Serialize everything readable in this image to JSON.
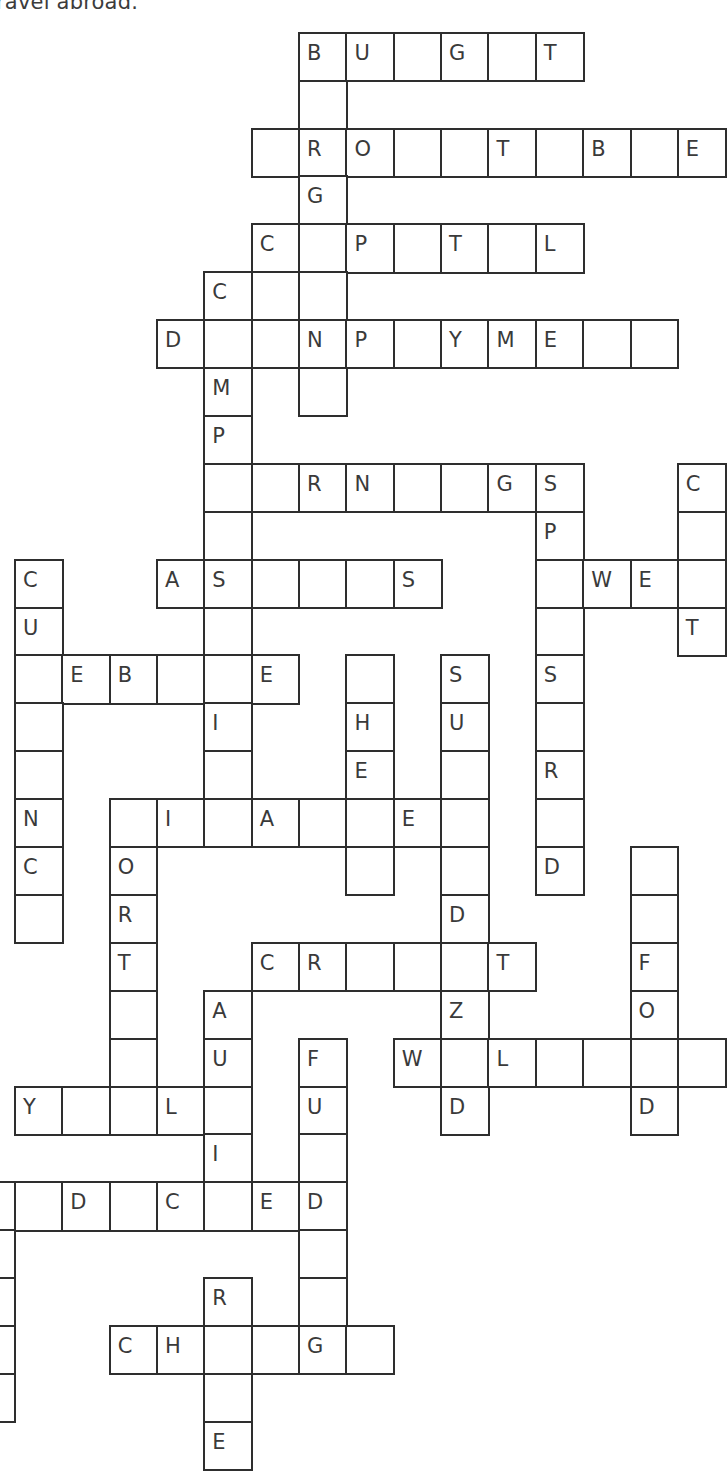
{
  "caption": "ravel abroad.",
  "grid": {
    "origin_x": 15.2,
    "origin_y": 33,
    "cell_w": 47.35,
    "cell_h": 47.9,
    "cells": [
      {
        "r": 0,
        "c": 6,
        "ch": "B"
      },
      {
        "r": 0,
        "c": 7,
        "ch": "U"
      },
      {
        "r": 0,
        "c": 8,
        "ch": ""
      },
      {
        "r": 0,
        "c": 9,
        "ch": "G"
      },
      {
        "r": 0,
        "c": 10,
        "ch": ""
      },
      {
        "r": 0,
        "c": 11,
        "ch": "T"
      },
      {
        "r": 1,
        "c": 6,
        "ch": ""
      },
      {
        "r": 2,
        "c": 5,
        "ch": ""
      },
      {
        "r": 2,
        "c": 6,
        "ch": "R"
      },
      {
        "r": 2,
        "c": 7,
        "ch": "O"
      },
      {
        "r": 2,
        "c": 8,
        "ch": ""
      },
      {
        "r": 2,
        "c": 9,
        "ch": ""
      },
      {
        "r": 2,
        "c": 10,
        "ch": "T"
      },
      {
        "r": 2,
        "c": 11,
        "ch": ""
      },
      {
        "r": 2,
        "c": 12,
        "ch": "B"
      },
      {
        "r": 2,
        "c": 13,
        "ch": ""
      },
      {
        "r": 2,
        "c": 14,
        "ch": "E"
      },
      {
        "r": 3,
        "c": 6,
        "ch": "G"
      },
      {
        "r": 4,
        "c": 5,
        "ch": "C"
      },
      {
        "r": 4,
        "c": 6,
        "ch": ""
      },
      {
        "r": 4,
        "c": 7,
        "ch": "P"
      },
      {
        "r": 4,
        "c": 8,
        "ch": ""
      },
      {
        "r": 4,
        "c": 9,
        "ch": "T"
      },
      {
        "r": 4,
        "c": 10,
        "ch": ""
      },
      {
        "r": 4,
        "c": 11,
        "ch": "L"
      },
      {
        "r": 5,
        "c": 4,
        "ch": "C"
      },
      {
        "r": 5,
        "c": 5,
        "ch": ""
      },
      {
        "r": 5,
        "c": 6,
        "ch": ""
      },
      {
        "r": 6,
        "c": 3,
        "ch": "D"
      },
      {
        "r": 6,
        "c": 4,
        "ch": ""
      },
      {
        "r": 6,
        "c": 5,
        "ch": ""
      },
      {
        "r": 6,
        "c": 6,
        "ch": "N"
      },
      {
        "r": 6,
        "c": 7,
        "ch": "P"
      },
      {
        "r": 6,
        "c": 8,
        "ch": ""
      },
      {
        "r": 6,
        "c": 9,
        "ch": "Y"
      },
      {
        "r": 6,
        "c": 10,
        "ch": "M"
      },
      {
        "r": 6,
        "c": 11,
        "ch": "E"
      },
      {
        "r": 6,
        "c": 12,
        "ch": ""
      },
      {
        "r": 6,
        "c": 13,
        "ch": ""
      },
      {
        "r": 7,
        "c": 4,
        "ch": "M"
      },
      {
        "r": 7,
        "c": 6,
        "ch": ""
      },
      {
        "r": 8,
        "c": 4,
        "ch": "P"
      },
      {
        "r": 9,
        "c": 4,
        "ch": ""
      },
      {
        "r": 9,
        "c": 5,
        "ch": ""
      },
      {
        "r": 9,
        "c": 6,
        "ch": "R"
      },
      {
        "r": 9,
        "c": 7,
        "ch": "N"
      },
      {
        "r": 9,
        "c": 8,
        "ch": ""
      },
      {
        "r": 9,
        "c": 9,
        "ch": ""
      },
      {
        "r": 9,
        "c": 10,
        "ch": "G"
      },
      {
        "r": 9,
        "c": 11,
        "ch": "S"
      },
      {
        "r": 9,
        "c": 14,
        "ch": "C"
      },
      {
        "r": 10,
        "c": 4,
        "ch": ""
      },
      {
        "r": 10,
        "c": 11,
        "ch": "P"
      },
      {
        "r": 10,
        "c": 14,
        "ch": ""
      },
      {
        "r": 11,
        "c": 0,
        "ch": "C"
      },
      {
        "r": 11,
        "c": 3,
        "ch": "A"
      },
      {
        "r": 11,
        "c": 4,
        "ch": "S"
      },
      {
        "r": 11,
        "c": 5,
        "ch": ""
      },
      {
        "r": 11,
        "c": 6,
        "ch": ""
      },
      {
        "r": 11,
        "c": 7,
        "ch": ""
      },
      {
        "r": 11,
        "c": 8,
        "ch": "S"
      },
      {
        "r": 11,
        "c": 11,
        "ch": ""
      },
      {
        "r": 11,
        "c": 12,
        "ch": "W"
      },
      {
        "r": 11,
        "c": 13,
        "ch": "E"
      },
      {
        "r": 11,
        "c": 14,
        "ch": ""
      },
      {
        "r": 12,
        "c": 0,
        "ch": "U"
      },
      {
        "r": 12,
        "c": 4,
        "ch": ""
      },
      {
        "r": 12,
        "c": 11,
        "ch": ""
      },
      {
        "r": 12,
        "c": 14,
        "ch": "T"
      },
      {
        "r": 13,
        "c": 0,
        "ch": ""
      },
      {
        "r": 13,
        "c": 1,
        "ch": "E"
      },
      {
        "r": 13,
        "c": 2,
        "ch": "B"
      },
      {
        "r": 13,
        "c": 3,
        "ch": ""
      },
      {
        "r": 13,
        "c": 4,
        "ch": ""
      },
      {
        "r": 13,
        "c": 5,
        "ch": "E"
      },
      {
        "r": 13,
        "c": 7,
        "ch": ""
      },
      {
        "r": 13,
        "c": 9,
        "ch": "S"
      },
      {
        "r": 13,
        "c": 11,
        "ch": "S"
      },
      {
        "r": 14,
        "c": 0,
        "ch": ""
      },
      {
        "r": 14,
        "c": 4,
        "ch": "I"
      },
      {
        "r": 14,
        "c": 7,
        "ch": "H"
      },
      {
        "r": 14,
        "c": 9,
        "ch": "U"
      },
      {
        "r": 14,
        "c": 11,
        "ch": ""
      },
      {
        "r": 15,
        "c": 0,
        "ch": ""
      },
      {
        "r": 15,
        "c": 4,
        "ch": ""
      },
      {
        "r": 15,
        "c": 7,
        "ch": "E"
      },
      {
        "r": 15,
        "c": 9,
        "ch": ""
      },
      {
        "r": 15,
        "c": 11,
        "ch": "R"
      },
      {
        "r": 16,
        "c": 0,
        "ch": "N"
      },
      {
        "r": 16,
        "c": 2,
        "ch": ""
      },
      {
        "r": 16,
        "c": 3,
        "ch": "I"
      },
      {
        "r": 16,
        "c": 4,
        "ch": ""
      },
      {
        "r": 16,
        "c": 5,
        "ch": "A"
      },
      {
        "r": 16,
        "c": 6,
        "ch": ""
      },
      {
        "r": 16,
        "c": 7,
        "ch": ""
      },
      {
        "r": 16,
        "c": 8,
        "ch": "E"
      },
      {
        "r": 16,
        "c": 9,
        "ch": ""
      },
      {
        "r": 16,
        "c": 11,
        "ch": ""
      },
      {
        "r": 17,
        "c": 0,
        "ch": "C"
      },
      {
        "r": 17,
        "c": 2,
        "ch": "O"
      },
      {
        "r": 17,
        "c": 7,
        "ch": ""
      },
      {
        "r": 17,
        "c": 9,
        "ch": ""
      },
      {
        "r": 17,
        "c": 11,
        "ch": "D"
      },
      {
        "r": 17,
        "c": 13,
        "ch": ""
      },
      {
        "r": 18,
        "c": 0,
        "ch": ""
      },
      {
        "r": 18,
        "c": 2,
        "ch": "R"
      },
      {
        "r": 18,
        "c": 9,
        "ch": "D"
      },
      {
        "r": 18,
        "c": 13,
        "ch": ""
      },
      {
        "r": 19,
        "c": 2,
        "ch": "T"
      },
      {
        "r": 19,
        "c": 5,
        "ch": "C"
      },
      {
        "r": 19,
        "c": 6,
        "ch": "R"
      },
      {
        "r": 19,
        "c": 7,
        "ch": ""
      },
      {
        "r": 19,
        "c": 8,
        "ch": ""
      },
      {
        "r": 19,
        "c": 9,
        "ch": ""
      },
      {
        "r": 19,
        "c": 10,
        "ch": "T"
      },
      {
        "r": 19,
        "c": 13,
        "ch": "F"
      },
      {
        "r": 20,
        "c": 2,
        "ch": ""
      },
      {
        "r": 20,
        "c": 4,
        "ch": "A"
      },
      {
        "r": 20,
        "c": 9,
        "ch": "Z"
      },
      {
        "r": 20,
        "c": 13,
        "ch": "O"
      },
      {
        "r": 21,
        "c": 2,
        "ch": ""
      },
      {
        "r": 21,
        "c": 4,
        "ch": "U"
      },
      {
        "r": 21,
        "c": 6,
        "ch": "F"
      },
      {
        "r": 21,
        "c": 8,
        "ch": "W"
      },
      {
        "r": 21,
        "c": 9,
        "ch": ""
      },
      {
        "r": 21,
        "c": 10,
        "ch": "L"
      },
      {
        "r": 21,
        "c": 11,
        "ch": ""
      },
      {
        "r": 21,
        "c": 12,
        "ch": ""
      },
      {
        "r": 21,
        "c": 13,
        "ch": ""
      },
      {
        "r": 21,
        "c": 14,
        "ch": ""
      },
      {
        "r": 22,
        "c": 0,
        "ch": "Y"
      },
      {
        "r": 22,
        "c": 1,
        "ch": ""
      },
      {
        "r": 22,
        "c": 2,
        "ch": ""
      },
      {
        "r": 22,
        "c": 3,
        "ch": "L"
      },
      {
        "r": 22,
        "c": 4,
        "ch": ""
      },
      {
        "r": 22,
        "c": 6,
        "ch": "U"
      },
      {
        "r": 22,
        "c": 9,
        "ch": "D"
      },
      {
        "r": 22,
        "c": 13,
        "ch": "D"
      },
      {
        "r": 23,
        "c": 4,
        "ch": "I"
      },
      {
        "r": 23,
        "c": 6,
        "ch": ""
      },
      {
        "r": 24,
        "c": -1,
        "ch": ""
      },
      {
        "r": 24,
        "c": 0,
        "ch": ""
      },
      {
        "r": 24,
        "c": 1,
        "ch": "D"
      },
      {
        "r": 24,
        "c": 2,
        "ch": ""
      },
      {
        "r": 24,
        "c": 3,
        "ch": "C"
      },
      {
        "r": 24,
        "c": 4,
        "ch": ""
      },
      {
        "r": 24,
        "c": 5,
        "ch": "E"
      },
      {
        "r": 24,
        "c": 6,
        "ch": "D"
      },
      {
        "r": 25,
        "c": -1,
        "ch": ""
      },
      {
        "r": 25,
        "c": 6,
        "ch": ""
      },
      {
        "r": 26,
        "c": -1,
        "ch": ""
      },
      {
        "r": 26,
        "c": 4,
        "ch": "R"
      },
      {
        "r": 26,
        "c": 6,
        "ch": ""
      },
      {
        "r": 27,
        "c": -1,
        "ch": ""
      },
      {
        "r": 27,
        "c": 2,
        "ch": "C"
      },
      {
        "r": 27,
        "c": 3,
        "ch": "H"
      },
      {
        "r": 27,
        "c": 4,
        "ch": ""
      },
      {
        "r": 27,
        "c": 5,
        "ch": ""
      },
      {
        "r": 27,
        "c": 6,
        "ch": "G"
      },
      {
        "r": 27,
        "c": 7,
        "ch": ""
      },
      {
        "r": 28,
        "c": -1,
        "ch": ""
      },
      {
        "r": 28,
        "c": 4,
        "ch": ""
      },
      {
        "r": 29,
        "c": 4,
        "ch": "E"
      }
    ]
  }
}
